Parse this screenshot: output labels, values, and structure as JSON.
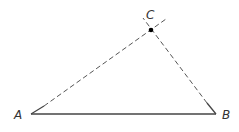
{
  "diagram": {
    "type": "geometry-triangle",
    "points": {
      "A": {
        "label": "A",
        "x": 31,
        "y": 114
      },
      "B": {
        "label": "B",
        "x": 216,
        "y": 114
      },
      "C": {
        "label": "C",
        "x": 151,
        "y": 30
      }
    },
    "segments": [
      {
        "from": "A",
        "to": "B",
        "style": "solid"
      },
      {
        "from": "A",
        "to": "C",
        "style": "dashed",
        "extends_past": "C"
      },
      {
        "from": "B",
        "to": "C",
        "style": "dashed",
        "extends_past": "C"
      }
    ],
    "colors": {
      "line": "#444444",
      "point": "#000000",
      "label": "#333333"
    }
  }
}
